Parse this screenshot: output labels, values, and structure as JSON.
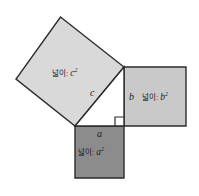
{
  "figure": {
    "background_color": "#ffffff",
    "stroke_color": "#2b2b2b",
    "squares": {
      "c": {
        "name": "hypotenuse-square",
        "fill": "#d9d9d9",
        "area_label": "넓이: ",
        "area_var": "c",
        "area_exp": "2",
        "side_label": "c",
        "points": "60.5,17 124,67 75,126 16,79"
      },
      "b": {
        "name": "leg-b-square",
        "fill": "#c9c9c9",
        "area_label": "넓이: ",
        "area_var": "b",
        "area_exp": "2",
        "side_label": "b",
        "points": "124,67 186,67 186,126 124,126"
      },
      "a": {
        "name": "leg-a-square",
        "fill": "#8c8c8c",
        "area_label": "넓이: ",
        "area_var": "a",
        "area_exp": "2",
        "side_label": "a",
        "points": "75,126 124,126 124,178 75,178"
      }
    },
    "triangle": {
      "name": "right-triangle",
      "fill": "#ffffff",
      "points": "75,126 124,126 124,67"
    },
    "right_angle_marker": {
      "name": "right-angle-marker",
      "points": "115,126 115,117 124,117"
    }
  }
}
